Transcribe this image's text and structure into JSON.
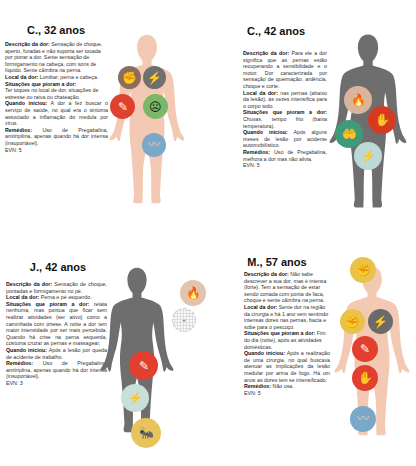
{
  "panels": [
    {
      "title": "C., 32 anos",
      "figure_color": "#f3c9b4",
      "fields": {
        "descricao_label": "Descrição da dor:",
        "descricao": "Sensação de choque, aperto, furadas e não suporta ser tocada por piorar a dor. Sente sensação de formigamento na cabeça, com sons de líquido. Sente câimbra na perna.",
        "local_label": "Local da dor:",
        "local": "Lombar, perna e cabeça.",
        "situacoes_label": "Situações que pioram a dor:",
        "situacoes": "Ter toques no local de dor, situações de estresse ou raiva ou chateação.",
        "inicio_label": "Quando iniciou:",
        "inicio": "A dor a fez buscar o serviço de saúde, no qual era o sintoma associado a inflamação do medula por vírus.",
        "remedios_label": "Remédios:",
        "remedios": "Uso de Pregabalina, amitripilina, apenas quando há dor intensa (insuportável).",
        "evn": "EVN: 5"
      },
      "icons": [
        {
          "name": "pressing-squeeze-icon",
          "glyph": "✊",
          "color": "#8a6e5c"
        },
        {
          "name": "lightning-shock-icon",
          "glyph": "⚡",
          "color": "#6f6f6f"
        },
        {
          "name": "needle-stab-icon",
          "glyph": "✎",
          "color": "#e2402e"
        },
        {
          "name": "stress-person-icon",
          "glyph": "☹",
          "color": "#7cb668"
        },
        {
          "name": "cramp-leg-icon",
          "glyph": "〰",
          "color": "#7aa8c9"
        }
      ]
    },
    {
      "title": "C., 42 anos",
      "figure_color": "#6e6e6e",
      "fields": {
        "descricao_label": "Descrição da dor:",
        "descricao": "Para ele a dor significa que as pernas estão recuperando a sensibilidade e o motor. Dor caracterizada por sensação de queimação, ardência, choque e corte.",
        "local_label": "Local da dor:",
        "local": "nas pernas (abaixo da lesão), às vezes intensifica para o corpo todo.",
        "situacoes_label": "Situações que pioram a dor:",
        "situacoes": "Chuvas, tempo frio (baixa temperatura).",
        "inicio_label": "Quando iniciou:",
        "inicio": "Após alguns meses de lesão por acidente automobilístico.",
        "remedios_label": "Remédios:",
        "remedios": "Uso de Pregabalina, melhora a dor mas não alivia.",
        "evn": "EVN: 5"
      },
      "icons": [
        {
          "name": "fire-burning-icon",
          "glyph": "🔥",
          "color": "#d9b59c"
        },
        {
          "name": "hand-cut-icon",
          "glyph": "✋",
          "color": "#d63a22"
        },
        {
          "name": "hand-ache-icon",
          "glyph": "🤲",
          "color": "#3f9a7a"
        },
        {
          "name": "lightning-shock-icon",
          "glyph": "⚡",
          "color": "#bcd9d6"
        }
      ]
    },
    {
      "title": "J., 42 anos",
      "figure_color": "#6e6e6e",
      "fields": {
        "descricao_label": "Descrição da dor:",
        "descricao": "Sensação de choque, pontadas e formigamento no pé.",
        "local_label": "Local da dor:",
        "local": "Perna e pé esquerdo.",
        "situacoes_label": "Situações que pioram a dor:",
        "situacoes": "relata nenhuma, mas pontua que ficar sem realizar atividades (ser ativo) como a caminhada com órtese. A noite a dor tem maior intensidade por ser mais percebida. Quando há crise na perna esquerda, costuma cruzar as pernas e massagear.",
        "inicio_label": "Quando iniciou:",
        "inicio": "Após a lesão por queda de acidente de trabalho.",
        "remedios_label": "Remédios:",
        "remedios": "Uso de Pregabalina, amitriplina, apenas quando há dor intensa (insuportável).",
        "evn": "EVN: 3"
      },
      "icons": [
        {
          "name": "fire-burning-icon",
          "glyph": "🔥",
          "color": "#e3c3ae"
        },
        {
          "name": "tingling-dots-icon",
          "glyph": "·",
          "color": "#f2f2f2"
        },
        {
          "name": "needle-stab-icon",
          "glyph": "✎",
          "color": "#e2402e"
        },
        {
          "name": "lightning-shock-icon",
          "glyph": "⚡",
          "color": "#c8dfda"
        },
        {
          "name": "ant-tingling-icon",
          "glyph": "🐜",
          "color": "#e9c45c"
        }
      ]
    },
    {
      "title": "M., 57 anos",
      "figure_color": "#f3c9b4",
      "fields": {
        "descricao_label": "Descrição da dor:",
        "descricao": "Não sabe descrever a sua dor, mas é intensa (forte). Tem a sensação de estar sendo cortada com ponta de faca, choque e sente câimbra na perna.",
        "local_label": "Local da dor:",
        "local": "Sente dor na região da cirurgia e há 1 ano vem sentindo intensas dores nas pernas, bacia e sobe para o pescoço.",
        "situacoes_label": "Situações que pioram a dor:",
        "situacoes": "Fim do dia (noite), após as atividades domésticas.",
        "inicio_label": "Quando iniciou:",
        "inicio": "Após a realização de uma cirurgia, no qual buscava atenuar as implicações da lesão medular por arma de fogo. Há um anos as dores tem se intensificado.",
        "remedios_label": "Remédios:",
        "remedios": "Não usa.",
        "evn": "EVN: 5"
      },
      "icons": [
        {
          "name": "fist-squeeze-icon",
          "glyph": "✊",
          "color": "#e9c24a"
        },
        {
          "name": "fist-squeeze-icon",
          "glyph": "✊",
          "color": "#e9c24a"
        },
        {
          "name": "lightning-shock-icon",
          "glyph": "⚡",
          "color": "#6a6a6a"
        },
        {
          "name": "needle-stab-icon",
          "glyph": "✎",
          "color": "#e2402e"
        },
        {
          "name": "hand-cut-icon",
          "glyph": "✋",
          "color": "#e2402e"
        },
        {
          "name": "cramp-leg-icon",
          "glyph": "〰",
          "color": "#7aa8c9"
        }
      ]
    }
  ]
}
